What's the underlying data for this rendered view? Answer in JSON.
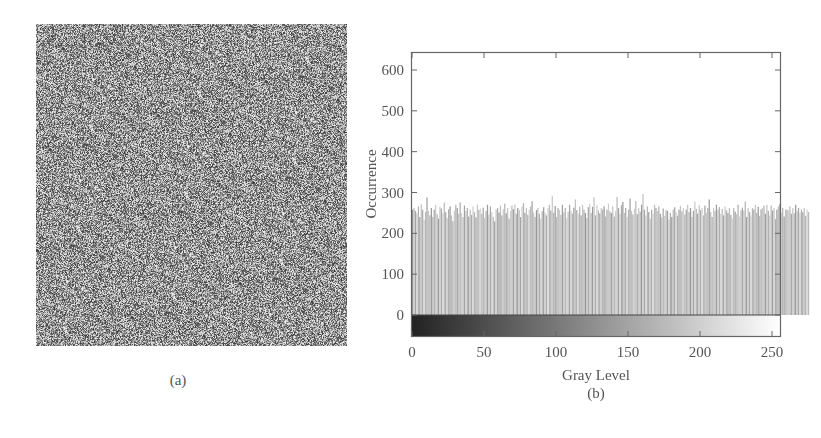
{
  "panels": {
    "a": {
      "caption": "(a)",
      "description": "random noise grayscale image"
    },
    "b": {
      "caption": "(b)"
    }
  },
  "chart_data": {
    "type": "bar",
    "title": "",
    "xlabel": "Gray Level",
    "ylabel": "Occurrence",
    "xlim": [
      0,
      255
    ],
    "ylim": [
      -55,
      640
    ],
    "xticks": [
      0,
      50,
      100,
      150,
      200,
      250
    ],
    "yticks": [
      0,
      100,
      200,
      300,
      400,
      500,
      600
    ],
    "grid": false,
    "legend": null,
    "colorbar": {
      "position": "below zero line",
      "range": [
        0,
        255
      ],
      "from": "#222222",
      "to": "#ffffff"
    },
    "series": [
      {
        "name": "histogram",
        "description": "approximately uniform histogram over gray levels 0-255, counts ranging ~225-295, mean ~256",
        "x_range": [
          0,
          255
        ],
        "values": [
          258,
          262,
          255,
          249,
          266,
          240,
          271,
          258,
          233,
          252,
          288,
          255,
          244,
          262,
          240,
          258,
          270,
          247,
          236,
          265,
          261,
          249,
          275,
          252,
          238,
          259,
          266,
          244,
          230,
          256,
          270,
          262,
          248,
          276,
          250,
          240,
          268,
          255,
          262,
          241,
          258,
          245,
          266,
          252,
          239,
          270,
          257,
          261,
          248,
          263,
          237,
          255,
          270,
          246,
          266,
          252,
          240,
          229,
          258,
          262,
          251,
          268,
          244,
          259,
          273,
          249,
          262,
          236,
          255,
          268,
          259,
          271,
          248,
          262,
          257,
          240,
          266,
          274,
          250,
          262,
          245,
          258,
          266,
          279,
          251,
          240,
          257,
          262,
          248,
          236,
          255,
          264,
          250,
          244,
          262,
          270,
          256,
          292,
          250,
          267,
          240,
          262,
          257,
          245,
          270,
          252,
          262,
          238,
          253,
          270,
          255,
          248,
          263,
          283,
          257,
          248,
          265,
          244,
          270,
          258,
          250,
          238,
          264,
          272,
          250,
          265,
          288,
          244,
          270,
          256,
          249,
          262,
          258,
          266,
          241,
          258,
          272,
          254,
          250,
          266,
          241,
          255,
          289,
          262,
          248,
          269,
          277,
          250,
          262,
          240,
          258,
          285,
          255,
          246,
          260,
          279,
          247,
          262,
          253,
          270,
          296,
          258,
          244,
          266,
          252,
          236,
          258,
          249,
          270,
          262,
          255,
          266,
          248,
          239,
          261,
          243,
          257,
          255,
          233,
          250,
          240,
          258,
          264,
          252,
          243,
          258,
          267,
          254,
          262,
          246,
          258,
          270,
          252,
          262,
          240,
          255,
          278,
          260,
          248,
          269,
          257,
          262,
          244,
          268,
          250,
          262,
          283,
          252,
          240,
          262,
          255,
          270,
          258,
          264,
          248,
          260,
          244,
          266,
          256,
          250,
          262,
          245,
          236,
          262,
          253,
          247,
          270,
          241,
          256,
          263,
          256,
          278,
          240,
          262,
          252,
          244,
          262,
          258,
          270,
          250,
          265,
          242,
          259,
          262,
          268,
          248,
          270,
          255,
          244,
          268,
          256,
          262,
          235,
          258,
          266,
          272,
          250,
          262,
          241,
          258,
          258,
          256,
          266,
          248,
          262,
          249,
          270,
          254,
          262,
          250,
          258,
          252,
          262,
          243,
          258,
          252
        ]
      }
    ],
    "annotations": []
  }
}
